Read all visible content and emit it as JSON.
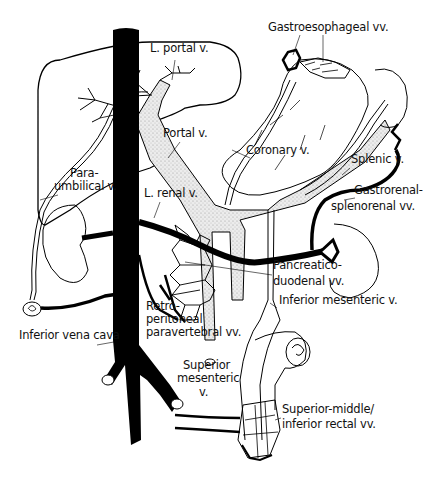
{
  "diagram": {
    "colors": {
      "ink": "#000000",
      "portal_stipple": "#d8d8d8",
      "background": "#ffffff"
    },
    "labels": [
      {
        "id": "l-portal-v",
        "text": "L. portal v.",
        "x": 150,
        "y": 52
      },
      {
        "id": "gastroesophageal-vv",
        "text": "Gastroesophageal vv.",
        "x": 268,
        "y": 31
      },
      {
        "id": "portal-v",
        "text": "Portal v.",
        "x": 163,
        "y": 137
      },
      {
        "id": "coronary-v",
        "text": "Coronary v.",
        "x": 246,
        "y": 154
      },
      {
        "id": "splenic-v",
        "text": "Splenic v.",
        "x": 351,
        "y": 163
      },
      {
        "id": "para-umbilical-v-1",
        "text": "Para-",
        "x": 70,
        "y": 177
      },
      {
        "id": "para-umbilical-v-2",
        "text": "umbilical v.",
        "x": 54,
        "y": 190
      },
      {
        "id": "l-renal-v",
        "text": "L. renal v.",
        "x": 144,
        "y": 197
      },
      {
        "id": "gastrorenal-1",
        "text": "Gastrorenal-",
        "x": 354,
        "y": 194
      },
      {
        "id": "gastrorenal-2",
        "text": "splenorenal vv.",
        "x": 331,
        "y": 210
      },
      {
        "id": "pancreaticoduodenal-1",
        "text": "Pancreatico-",
        "x": 273,
        "y": 269
      },
      {
        "id": "pancreaticoduodenal-2",
        "text": "duodenal vv.",
        "x": 273,
        "y": 285
      },
      {
        "id": "inferior-mesenteric-v",
        "text": "Inferior mesenteric v.",
        "x": 279,
        "y": 304
      },
      {
        "id": "retroperitoneal-1",
        "text": "Retro-",
        "x": 146,
        "y": 310
      },
      {
        "id": "retroperitoneal-2",
        "text": "peritoneal",
        "x": 146,
        "y": 323
      },
      {
        "id": "retroperitoneal-3",
        "text": "paravertebral vv.",
        "x": 146,
        "y": 336
      },
      {
        "id": "inferior-vena-cava",
        "text": "Inferior vena cava",
        "x": 19,
        "y": 339
      },
      {
        "id": "superior-mesenteric-1",
        "text": "Superior",
        "x": 183,
        "y": 369
      },
      {
        "id": "superior-mesenteric-2",
        "text": "mesenteric",
        "x": 177,
        "y": 382
      },
      {
        "id": "superior-mesenteric-3",
        "text": "v.",
        "x": 199,
        "y": 396
      },
      {
        "id": "rectal-vv-1",
        "text": "Superior-middle/",
        "x": 282,
        "y": 413
      },
      {
        "id": "rectal-vv-2",
        "text": "inferior rectal vv.",
        "x": 282,
        "y": 428
      }
    ]
  }
}
